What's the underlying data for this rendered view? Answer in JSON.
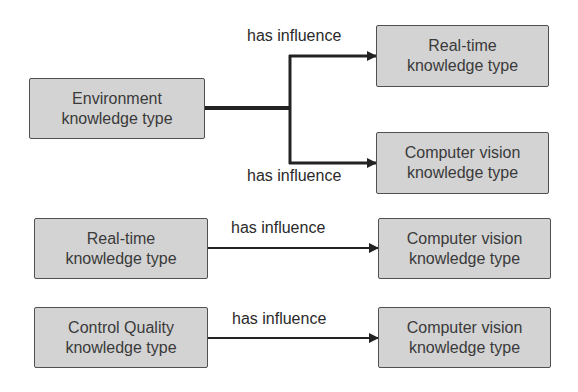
{
  "diagram": {
    "nodes": [
      {
        "id": "env",
        "line1": "Environment",
        "line2": "knowledge type"
      },
      {
        "id": "rt_top",
        "line1": "Real-time",
        "line2": "knowledge type"
      },
      {
        "id": "cv_top",
        "line1": "Computer vision",
        "line2": "knowledge type"
      },
      {
        "id": "rt_left",
        "line1": "Real-time",
        "line2": "knowledge type"
      },
      {
        "id": "cv_mid",
        "line1": "Computer vision",
        "line2": "knowledge type"
      },
      {
        "id": "cq_left",
        "line1": "Control Quality",
        "line2": "knowledge type"
      },
      {
        "id": "cv_bottom",
        "line1": "Computer vision",
        "line2": "knowledge type"
      }
    ],
    "edges": [
      {
        "from": "env",
        "to": "rt_top",
        "label": "has influence"
      },
      {
        "from": "env",
        "to": "cv_top",
        "label": "has influence"
      },
      {
        "from": "rt_left",
        "to": "cv_mid",
        "label": "has influence"
      },
      {
        "from": "cq_left",
        "to": "cv_bottom",
        "label": "has influence"
      }
    ],
    "colors": {
      "node_fill": "#d3d3d3",
      "node_border": "#505050",
      "edge": "#222222"
    }
  }
}
